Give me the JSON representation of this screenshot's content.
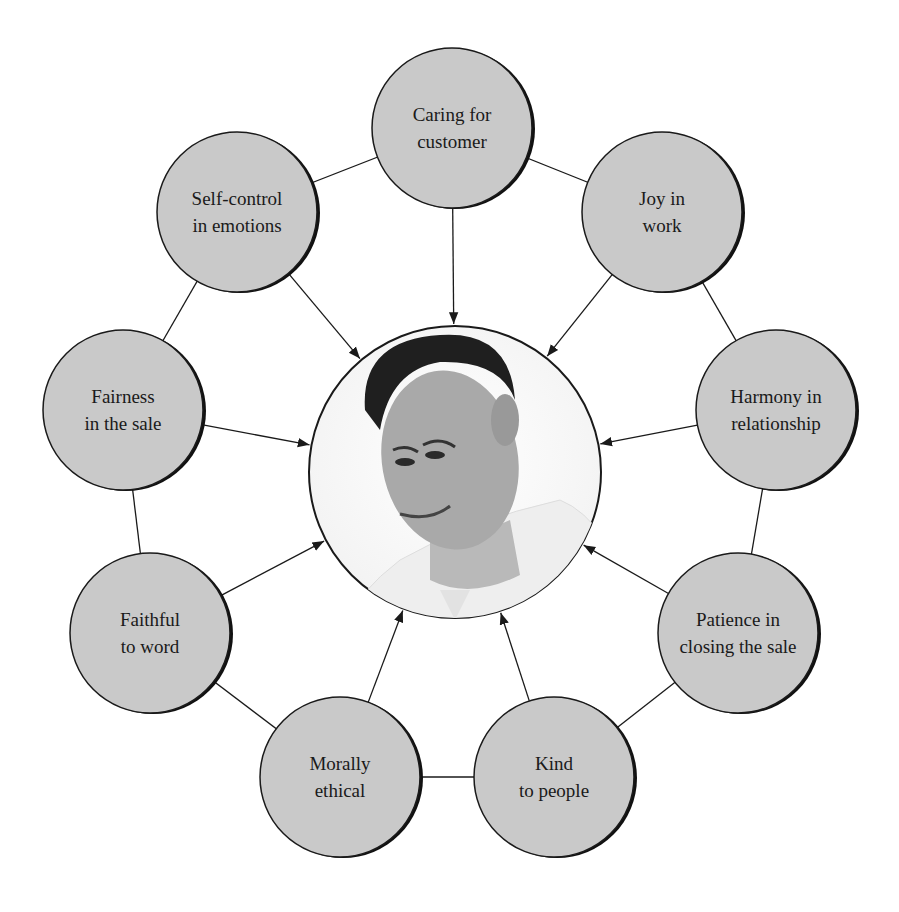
{
  "diagram": {
    "center": {
      "label": "Salesperson portrait",
      "cx": 455,
      "cy": 472,
      "r": 146
    },
    "colors": {
      "bubble_fill": "#c9c9c9",
      "stroke": "#1a1a1a",
      "background": "#ffffff"
    },
    "nodes": [
      {
        "id": "caring",
        "line1": "Caring for",
        "line2": "customer",
        "cx": 452,
        "cy": 128
      },
      {
        "id": "joy",
        "line1": "Joy in",
        "line2": "work",
        "cx": 662,
        "cy": 212
      },
      {
        "id": "harmony",
        "line1": "Harmony in",
        "line2": "relationship",
        "cx": 776,
        "cy": 410
      },
      {
        "id": "patience",
        "line1": "Patience in",
        "line2": "closing the sale",
        "cx": 738,
        "cy": 633
      },
      {
        "id": "kind",
        "line1": "Kind",
        "line2": "to people",
        "cx": 554,
        "cy": 777
      },
      {
        "id": "morally",
        "line1": "Morally",
        "line2": "ethical",
        "cx": 340,
        "cy": 777
      },
      {
        "id": "faithful",
        "line1": "Faithful",
        "line2": "to word",
        "cx": 150,
        "cy": 633
      },
      {
        "id": "fairness",
        "line1": "Fairness",
        "line2": "in the sale",
        "cx": 123,
        "cy": 410
      },
      {
        "id": "selfcontrol",
        "line1": "Self-control",
        "line2": "in emotions",
        "cx": 237,
        "cy": 212
      }
    ],
    "node_radius": 80
  }
}
